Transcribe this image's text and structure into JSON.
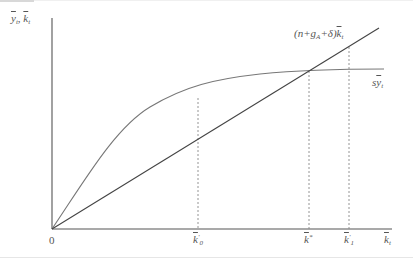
{
  "diagram": {
    "type": "solow-growth-diagram",
    "y_axis_label": {
      "y": "y",
      "sep": ", ",
      "k": "k",
      "sub": "t"
    },
    "x_axis_label": {
      "k": "k",
      "sub": "t"
    },
    "origin_label": "0",
    "break_even_line_label": {
      "prefix": "(n+g",
      "sub_A": "A",
      "mid": "+δ)",
      "k": "k",
      "sub": "t"
    },
    "saving_curve_label": {
      "s": "s",
      "y": "y",
      "sub": "t"
    },
    "x_ticks": [
      {
        "name": "k0-prime",
        "k": "k",
        "sup": "′",
        "sub": "0"
      },
      {
        "name": "k-star",
        "k": "k",
        "sup": "*",
        "sub": ""
      },
      {
        "name": "k1-prime",
        "k": "k",
        "sup": "′",
        "sub": "1"
      }
    ],
    "colors": {
      "axis": "#555555",
      "line": "#444444",
      "curve": "#777777",
      "dashed": "#888888",
      "text": "#555555"
    }
  }
}
